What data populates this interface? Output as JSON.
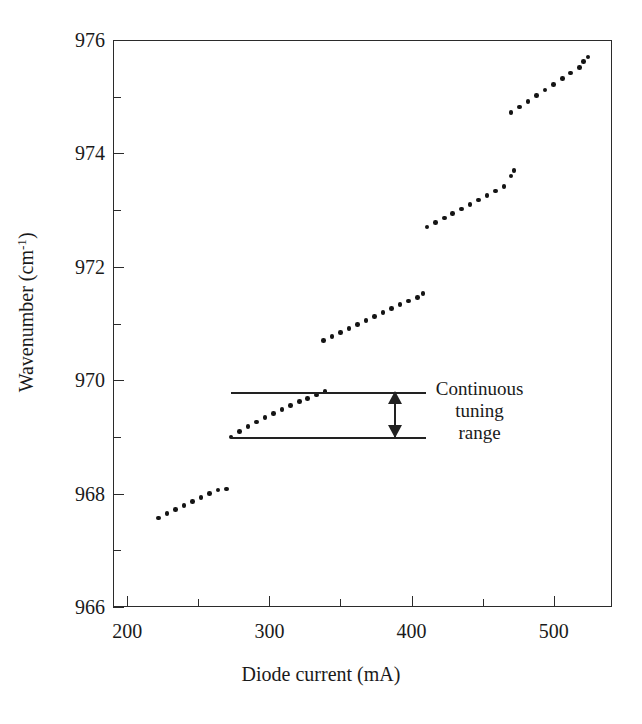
{
  "chart_data": {
    "type": "scatter",
    "title": "",
    "xlabel": "Diode current (mA)",
    "ylabel": "Wavenumber (cm",
    "ylabel_superscript": "-1",
    "ylabel_suffix": ")",
    "xlim": [
      190,
      541
    ],
    "ylim": [
      966,
      976
    ],
    "xticks": [
      200,
      300,
      400,
      500
    ],
    "xticks_minor": [
      250,
      350,
      450
    ],
    "xtick_labels": [
      "200",
      "300",
      "400",
      "500"
    ],
    "yticks": [
      966,
      968,
      970,
      972,
      974,
      976
    ],
    "ytick_labels": [
      "966",
      "968",
      "970",
      "972",
      "974",
      "976"
    ],
    "yticks_minor": [
      967,
      969,
      971,
      973,
      975
    ],
    "grid": false,
    "legend": false,
    "marker_color": "#141414",
    "axis_color": "#2b2b2b",
    "series": [
      {
        "name": "mode-segment-1",
        "points": [
          [
            222,
            967.57
          ],
          [
            228,
            967.65
          ],
          [
            234,
            967.72
          ],
          [
            240,
            967.79
          ],
          [
            246,
            967.86
          ],
          [
            252,
            967.93
          ],
          [
            258,
            968.0
          ],
          [
            264,
            968.06
          ],
          [
            270,
            968.08
          ]
        ]
      },
      {
        "name": "mode-segment-2",
        "points": [
          [
            273,
            969.0
          ],
          [
            279,
            969.1
          ],
          [
            285,
            969.18
          ],
          [
            291,
            969.26
          ],
          [
            297,
            969.34
          ],
          [
            303,
            969.41
          ],
          [
            309,
            969.48
          ],
          [
            315,
            969.55
          ],
          [
            321,
            969.62
          ],
          [
            327,
            969.68
          ],
          [
            333,
            969.74
          ],
          [
            339,
            969.8
          ]
        ]
      },
      {
        "name": "mode-segment-3",
        "points": [
          [
            338,
            970.7
          ],
          [
            344,
            970.77
          ],
          [
            350,
            970.84
          ],
          [
            356,
            970.91
          ],
          [
            362,
            970.98
          ],
          [
            368,
            971.05
          ],
          [
            374,
            971.12
          ],
          [
            380,
            971.19
          ],
          [
            386,
            971.26
          ],
          [
            392,
            971.33
          ],
          [
            398,
            971.4
          ],
          [
            404,
            971.46
          ],
          [
            408,
            971.53
          ]
        ]
      },
      {
        "name": "mode-segment-4",
        "points": [
          [
            411,
            972.7
          ],
          [
            417,
            972.78
          ],
          [
            423,
            972.86
          ],
          [
            429,
            972.94
          ],
          [
            435,
            973.02
          ],
          [
            441,
            973.1
          ],
          [
            447,
            973.18
          ],
          [
            453,
            973.26
          ],
          [
            459,
            973.34
          ],
          [
            465,
            973.42
          ],
          [
            470,
            973.6
          ],
          [
            472,
            973.7
          ]
        ]
      },
      {
        "name": "mode-segment-5",
        "points": [
          [
            470,
            974.72
          ],
          [
            476,
            974.82
          ],
          [
            482,
            974.92
          ],
          [
            488,
            975.02
          ],
          [
            494,
            975.12
          ],
          [
            500,
            975.22
          ],
          [
            506,
            975.32
          ],
          [
            512,
            975.42
          ],
          [
            518,
            975.52
          ],
          [
            521,
            975.62
          ],
          [
            524,
            975.7
          ]
        ]
      }
    ],
    "annotations": [
      {
        "name": "continuous-tuning-range",
        "text_lines": [
          "Continuous",
          "tuning",
          "range"
        ],
        "upper_line_y": 969.8,
        "lower_line_y": 969.0,
        "line_x_start": 273,
        "line_x_end": 410,
        "arrow_x": 388,
        "arrow_style": "double-headed-vertical"
      }
    ]
  }
}
